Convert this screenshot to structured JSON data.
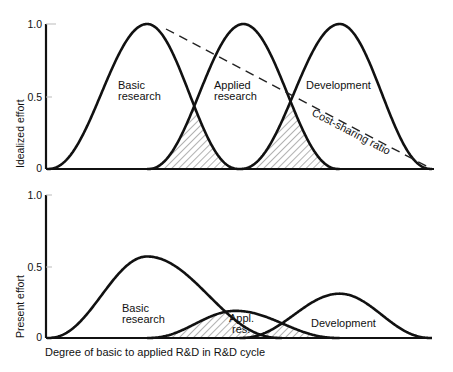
{
  "chart_data": [
    {
      "type": "line",
      "panel": "top",
      "title": "",
      "xlabel": "",
      "ylabel": "Idealized effort",
      "ylim": [
        0,
        1.0
      ],
      "yticks": [
        "0",
        "0.5",
        "1.0"
      ],
      "grid": false,
      "x_range": [
        0,
        1
      ],
      "series": [
        {
          "name": "Basic research",
          "label_lines": [
            "Basic",
            "research"
          ],
          "peak_x": 0.26,
          "peak_y": 1.0,
          "start_x": 0.0,
          "end_x": 0.5
        },
        {
          "name": "Applied research",
          "label_lines": [
            "Applied",
            "research"
          ],
          "peak_x": 0.51,
          "peak_y": 1.0,
          "start_x": 0.26,
          "end_x": 0.76
        },
        {
          "name": "Development",
          "label_lines": [
            "Development"
          ],
          "peak_x": 0.76,
          "peak_y": 1.0,
          "start_x": 0.5,
          "end_x": 1.0
        }
      ],
      "overlaps": [
        {
          "between": [
            "Basic research",
            "Applied research"
          ],
          "hatched": true,
          "cross_y": 0.43
        },
        {
          "between": [
            "Applied research",
            "Development"
          ],
          "hatched": true,
          "cross_y": 0.43
        }
      ],
      "annotations": [
        {
          "name": "Cost-sharing ratio",
          "style": "dashed",
          "from": [
            0.27,
            0.99
          ],
          "to": [
            1.0,
            0.0
          ]
        }
      ]
    },
    {
      "type": "line",
      "panel": "bottom",
      "title": "",
      "xlabel": "Degree of basic to applied R&D in R&D cycle",
      "ylabel": "Present effort",
      "ylim": [
        0,
        1.0
      ],
      "yticks": [
        "0",
        "0.5",
        "1.0"
      ],
      "grid": false,
      "x_range": [
        0,
        1
      ],
      "series": [
        {
          "name": "Basic research",
          "label_lines": [
            "Basic",
            "research"
          ],
          "peak_x": 0.26,
          "peak_y": 0.57,
          "start_x": 0.0,
          "end_x": 0.61
        },
        {
          "name": "Appl. res.",
          "label_lines": [
            "Appl.",
            "res."
          ],
          "peak_x": 0.49,
          "peak_y": 0.19,
          "start_x": 0.26,
          "end_x": 0.76
        },
        {
          "name": "Development",
          "label_lines": [
            "Development"
          ],
          "peak_x": 0.76,
          "peak_y": 0.31,
          "start_x": 0.5,
          "end_x": 1.0
        }
      ],
      "overlaps": [
        {
          "between": [
            "Basic research",
            "Appl. res."
          ],
          "hatched": true
        },
        {
          "between": [
            "Appl. res.",
            "Development"
          ],
          "hatched": true
        }
      ]
    }
  ],
  "panels": {
    "top": {
      "ylabel": "Idealized effort",
      "ticks": {
        "t0": "0",
        "t05": "0.5",
        "t1": "1.0"
      },
      "labels": {
        "basic_1": "Basic",
        "basic_2": "research",
        "applied_1": "Applied",
        "applied_2": "research",
        "dev": "Development",
        "cost": "Cost-sharing ratio"
      }
    },
    "bottom": {
      "ylabel": "Present effort",
      "ticks": {
        "t0": "0",
        "t05": "0.5",
        "t1": "1.0"
      },
      "labels": {
        "basic_1": "Basic",
        "basic_2": "research",
        "appl_1": "Appl.",
        "appl_2": "res.",
        "dev": "Development"
      },
      "xlabel": "Degree of basic to applied R&D in R&D cycle"
    }
  }
}
